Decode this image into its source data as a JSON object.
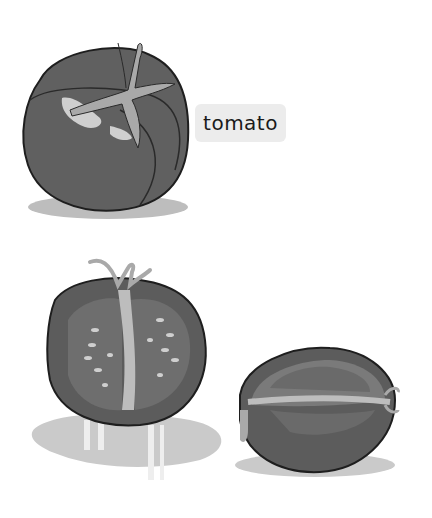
{
  "label": {
    "text": "tomato"
  },
  "illustrations": [
    {
      "name": "whole-tomato",
      "description": "Whole tomato with stem, top-left"
    },
    {
      "name": "halved-tomato-front",
      "description": "Tomato cut in half, cross-section view"
    },
    {
      "name": "halved-tomato-side",
      "description": "Tomato half lying on its side"
    }
  ],
  "colors": {
    "body_dark": "#555555",
    "body_mid": "#6a6a6a",
    "flesh": "#7a7a7a",
    "stem": "#a9a9a9",
    "highlight": "#cfcfcf",
    "shadow": "#c8c8c8",
    "outline": "#1e1e1e",
    "label_bg": "#ececec"
  }
}
